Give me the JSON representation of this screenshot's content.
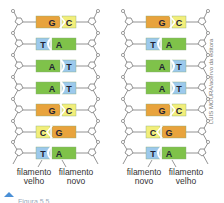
{
  "colors": {
    "G": "#e8a33d",
    "C": "#f2ee7a",
    "T": "#9cc9ec",
    "A": "#7fc24a",
    "backbone": "#777777"
  },
  "diagrams": [
    {
      "id": "left",
      "pairs": [
        {
          "left": "G",
          "right": "C"
        },
        {
          "left": "T",
          "right": "A"
        },
        {
          "left": "A",
          "right": "T"
        },
        {
          "left": "A",
          "right": "T"
        },
        {
          "left": "G",
          "right": "C"
        },
        {
          "left": "C",
          "right": "G"
        },
        {
          "left": "T",
          "right": "A"
        }
      ],
      "labels": {
        "left": "filamento velho",
        "right": "filamento novo"
      }
    },
    {
      "id": "right",
      "pairs": [
        {
          "left": "G",
          "right": "C"
        },
        {
          "left": "T",
          "right": "A"
        },
        {
          "left": "A",
          "right": "T"
        },
        {
          "left": "A",
          "right": "T"
        },
        {
          "left": "G",
          "right": "C"
        },
        {
          "left": "C",
          "right": "G"
        },
        {
          "left": "T",
          "right": "A"
        }
      ],
      "labels": {
        "left": "filamento novo",
        "right": "filamento velho"
      }
    }
  ],
  "labels": {
    "left_old_1": "filamento",
    "left_old_2": "velho",
    "left_new_1": "filamento",
    "left_new_2": "novo",
    "right_new_1": "filamento",
    "right_new_2": "novo",
    "right_old_1": "filamento",
    "right_old_2": "velho"
  },
  "credit": "LUIS MOURA/acervo da editora",
  "caption": "Figura 5.5 ..."
}
